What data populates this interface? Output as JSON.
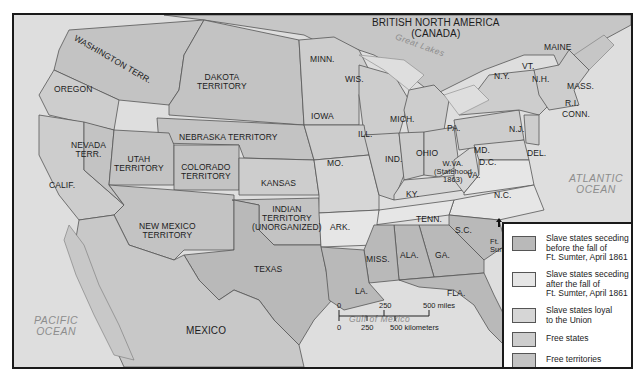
{
  "colors": {
    "slave_seceding_before": "#b9b9b9",
    "slave_seceding_after": "#e6e6e6",
    "slave_loyal": "#d6d6d6",
    "free_states": "#cdcdcd",
    "free_territories": "#c3c3c3",
    "foreign": "#c8c8c8",
    "water": "#dcdcdc",
    "border": "#555555"
  },
  "labels": {
    "canada": "BRITISH NORTH AMERICA",
    "canada2": "(CANADA)",
    "great_lakes": "Great Lakes",
    "washington": "WASHINGTON TERR.",
    "oregon": "OREGON",
    "dakota": "DAKOTA",
    "dakota2": "TERRITORY",
    "nebraska": "NEBRASKA TERRITORY",
    "nevada": "NEVADA",
    "nevada2": "TERR.",
    "utah": "UTAH",
    "utah2": "TERRITORY",
    "colorado": "COLORADO",
    "colorado2": "TERRITORY",
    "calif": "CALIF.",
    "kansas": "KANSAS",
    "new_mexico": "NEW MEXICO",
    "new_mexico2": "TERRITORY",
    "indian": "INDIAN",
    "indian2": "TERRITORY",
    "indian3": "(UNORGANIZED)",
    "texas": "TEXAS",
    "mexico": "MEXICO",
    "minn": "MINN.",
    "wis": "WIS.",
    "iowa": "IOWA",
    "ill": "ILL.",
    "mo": "MO.",
    "mich": "MICH.",
    "ind": "IND.",
    "ohio": "OHIO",
    "ky": "KY.",
    "tenn": "TENN.",
    "ark": "ARK.",
    "la": "LA.",
    "miss": "MISS.",
    "ala": "ALA.",
    "ga": "GA.",
    "fla": "FLA.",
    "sc": "S.C.",
    "nc": "N.C.",
    "va": "VA.",
    "wva": "W.VA.",
    "wva2": "(Statehood",
    "wva3": "1863)",
    "md": "MD.",
    "dc": "D.C.",
    "del": "DEL.",
    "pa": "PA.",
    "nj": "N.J.",
    "ny": "N.Y.",
    "vt": "VT.",
    "nh": "N.H.",
    "maine": "MAINE",
    "mass": "MASS.",
    "ri": "R.I.",
    "conn": "CONN.",
    "ft_sumter": "Ft.",
    "ft_sumter2": "Sumter",
    "atlantic": "ATLANTIC",
    "atlantic2": "OCEAN",
    "pacific": "PACIFIC",
    "pacific2": "OCEAN",
    "gulf": "Gulf of Mexico"
  },
  "legend": {
    "items": [
      {
        "line1": "Slave states seceding",
        "line2": "before the fall of",
        "line3": "Ft. Sumter, April 1861"
      },
      {
        "line1": "Slave states seceding",
        "line2": "after the fall of",
        "line3": "Ft. Sumter, April 1861"
      },
      {
        "line1": "Slave states loyal",
        "line2": "to the Union"
      },
      {
        "line1": "Free states"
      },
      {
        "line1": "Free territories"
      }
    ]
  },
  "scale": {
    "miles_0": "0",
    "miles_250": "250",
    "miles_500": "500 miles",
    "km_0": "0",
    "km_250": "250",
    "km_500": "500 kilometers"
  }
}
